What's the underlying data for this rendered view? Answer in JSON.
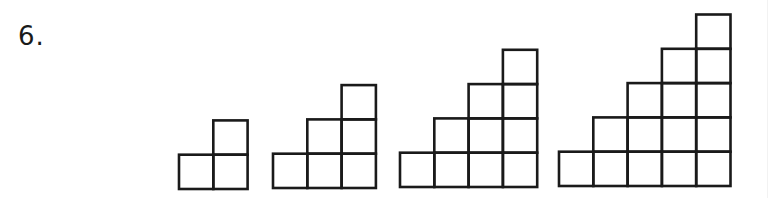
{
  "problem": {
    "number_label": "6."
  },
  "figures": [
    {
      "name": "figure-1",
      "steps": 2,
      "left": 179,
      "bottom": 189
    },
    {
      "name": "figure-2",
      "steps": 3,
      "left": 273,
      "bottom": 188
    },
    {
      "name": "figure-3",
      "steps": 4,
      "left": 400,
      "bottom": 187
    },
    {
      "name": "figure-4",
      "steps": 5,
      "left": 559,
      "bottom": 186
    }
  ],
  "style": {
    "cell_size": 34.3,
    "stroke_color": "#1a1a1a",
    "stroke_width": 2.6
  }
}
